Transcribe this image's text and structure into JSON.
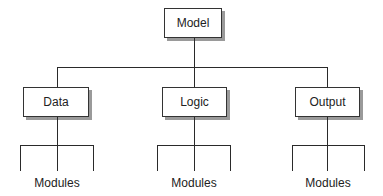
{
  "diagram": {
    "type": "hierarchy",
    "root": {
      "label": "Model"
    },
    "children": [
      {
        "label": "Data",
        "modules_label": "Modules"
      },
      {
        "label": "Logic",
        "modules_label": "Modules"
      },
      {
        "label": "Output",
        "modules_label": "Modules"
      }
    ]
  },
  "colors": {
    "line": "#2a2a2a",
    "box_border": "#333333",
    "box_shadow": "#9a9a9a",
    "text": "#222222"
  }
}
